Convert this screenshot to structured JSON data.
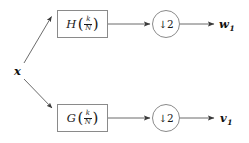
{
  "diagram": {
    "background_color": "#ffffff",
    "stroke_color": "#8a8a8a",
    "text_color": "#1a1a1a",
    "input": {
      "label": "x"
    },
    "branches": [
      {
        "id": "top",
        "filter": {
          "name": "H",
          "open_paren": "(",
          "numerator": "k",
          "denominator": "N",
          "close_paren": ")"
        },
        "downsampler": {
          "arrow": "↓",
          "factor": "2"
        },
        "output": {
          "label": "v",
          "base": "w",
          "subscript": "1"
        }
      },
      {
        "id": "bottom",
        "filter": {
          "name": "G",
          "open_paren": "(",
          "numerator": "k",
          "denominator": "N",
          "close_paren": ")"
        },
        "downsampler": {
          "arrow": "↓",
          "factor": "2"
        },
        "output": {
          "label": "v",
          "base": "v",
          "subscript": "1"
        }
      }
    ]
  }
}
